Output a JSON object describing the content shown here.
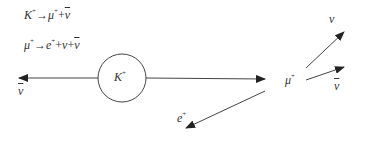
{
  "equations": {
    "kaon_decay": {
      "lhs": "K",
      "lhs_sup": "+",
      "arrow": "→",
      "p1": "μ",
      "p1_sup": "+",
      "plus": "+",
      "p2": "ν",
      "p2_bar": true
    },
    "muon_decay": {
      "lhs": "μ",
      "lhs_sup": "+",
      "arrow": "→",
      "p1": "e",
      "p1_sup": "+",
      "plus1": "+",
      "p2": "ν",
      "plus2": "+",
      "p3": "ν",
      "p3_bar": true
    }
  },
  "labels": {
    "kaon": "K",
    "kaon_sup": "+",
    "muon": "μ",
    "muon_sup": "+",
    "antineutrino_left": "ν",
    "neutrino": "ν",
    "antineutrino_right": "ν",
    "positron": "e",
    "positron_sup": "+"
  },
  "colors": {
    "line": "#333333",
    "background": "#ffffff"
  }
}
